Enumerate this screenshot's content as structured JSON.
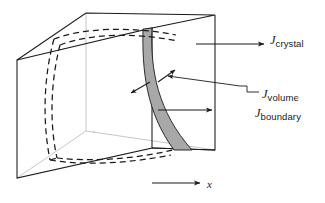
{
  "figure": {
    "title": "",
    "background_color": "#ffffff",
    "line_color": "#1a1a1a",
    "band_fill_color": "#a8a8a8",
    "hidden_edge_color": "#b0b0b0",
    "dashed_curve_color": "#1a1a1a"
  },
  "labels": {
    "crystal": {
      "symbol": "J",
      "subscript": "crystal"
    },
    "volume": {
      "symbol": "J",
      "subscript": "volume"
    },
    "boundary": {
      "symbol": "J",
      "subscript": "boundary"
    },
    "axis_x": "x"
  },
  "icons": {
    "arrow_crystal": "arrow-right-icon",
    "arrow_boundary": "arrow-right-icon",
    "arrow_volume_out": "arrow-up-right-icon",
    "arrow_volume_in": "arrow-left-icon",
    "arrow_volume_left": "arrow-down-left-icon",
    "axis_arrow": "arrow-right-icon"
  },
  "geometry": {
    "cube_front_top_left": [
      17,
      60
    ],
    "cube_front_top_right": [
      152,
      28
    ],
    "cube_front_bottom_left": [
      17,
      178
    ],
    "cube_front_bottom_right": [
      152,
      148
    ],
    "cube_back_top_left": [
      86,
      13
    ],
    "cube_back_top_right": [
      215,
      15
    ],
    "cube_back_bottom_right": [
      215,
      150
    ],
    "grain_boundary_band_top": [
      152,
      28
    ],
    "grain_boundary_band_bottom": [
      192,
      150
    ]
  }
}
